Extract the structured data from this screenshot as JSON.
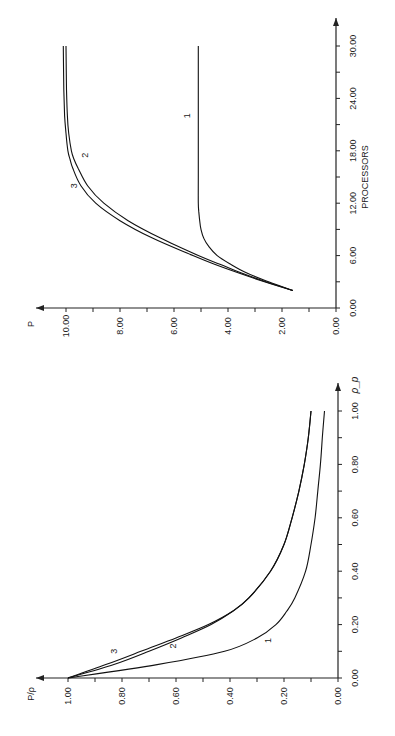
{
  "chart_data": [
    {
      "id": "speedup",
      "type": "line",
      "orientation": "rotated-90-ccw",
      "title": "",
      "xlabel": "PROCESSORS",
      "ylabel": "P",
      "xlim": [
        0,
        30
      ],
      "ylim": [
        0,
        11
      ],
      "xticks": [
        "0.00",
        "6.00",
        "12.00",
        "18.00",
        "24.00",
        "30.00"
      ],
      "yticks": [
        "0.00",
        "2.00",
        "4.00",
        "6.00",
        "8.00",
        "10.00"
      ],
      "grid": false,
      "series": [
        {
          "name": "1",
          "x": [
            2,
            3,
            4,
            5,
            6,
            7,
            8,
            9,
            10,
            11,
            12,
            15,
            20,
            25,
            30
          ],
          "values": [
            1.6,
            2.5,
            3.3,
            3.9,
            4.4,
            4.7,
            4.9,
            5.0,
            5.05,
            5.08,
            5.1,
            5.1,
            5.1,
            5.1,
            5.1
          ]
        },
        {
          "name": "2",
          "x": [
            2,
            3,
            4,
            5,
            6,
            8,
            10,
            12,
            14,
            16,
            17,
            18,
            20,
            22,
            25,
            30
          ],
          "values": [
            1.6,
            2.6,
            3.5,
            4.3,
            5.1,
            6.5,
            7.7,
            8.6,
            9.2,
            9.55,
            9.7,
            9.8,
            9.9,
            9.95,
            9.98,
            10.0
          ]
        },
        {
          "name": "3",
          "x": [
            2,
            3,
            4,
            5,
            6,
            8,
            10,
            12,
            14,
            16,
            17,
            18,
            20,
            22,
            25,
            30
          ],
          "values": [
            1.6,
            2.65,
            3.6,
            4.5,
            5.3,
            6.8,
            8.0,
            8.9,
            9.45,
            9.75,
            9.85,
            9.93,
            10.0,
            10.05,
            10.08,
            10.1
          ]
        }
      ],
      "labels": [
        {
          "text": "1",
          "x": 22,
          "y": 5.4
        },
        {
          "text": "2",
          "x": 17.5,
          "y": 9.2
        },
        {
          "text": "3",
          "x": 14,
          "y": 9.6
        }
      ]
    },
    {
      "id": "efficiency",
      "type": "line",
      "orientation": "rotated-90-ccw",
      "title": "",
      "xlabel": "ρ_p",
      "ylabel": "P/ρ",
      "xlim": [
        0,
        1.0
      ],
      "ylim": [
        0,
        1.0
      ],
      "xticks": [
        "0.00",
        "0.20",
        "0.40",
        "0.60",
        "0.80",
        "1.00"
      ],
      "yticks": [
        "0.00",
        "0.20",
        "0.40",
        "0.60",
        "0.80",
        "1.00"
      ],
      "grid": false,
      "series": [
        {
          "name": "1",
          "x": [
            0.0,
            0.05,
            0.1,
            0.15,
            0.2,
            0.25,
            0.3,
            0.4,
            0.5,
            0.6,
            0.7,
            0.8,
            0.9,
            1.0
          ],
          "values": [
            1.0,
            0.67,
            0.42,
            0.3,
            0.23,
            0.19,
            0.16,
            0.12,
            0.1,
            0.085,
            0.075,
            0.065,
            0.058,
            0.05
          ]
        },
        {
          "name": "2",
          "x": [
            0.0,
            0.05,
            0.1,
            0.15,
            0.2,
            0.25,
            0.3,
            0.4,
            0.5,
            0.6,
            0.7,
            0.8,
            0.9,
            1.0
          ],
          "values": [
            1.0,
            0.83,
            0.7,
            0.58,
            0.47,
            0.39,
            0.33,
            0.25,
            0.2,
            0.17,
            0.145,
            0.125,
            0.11,
            0.1
          ]
        },
        {
          "name": "3",
          "x": [
            0.0,
            0.05,
            0.1,
            0.15,
            0.2,
            0.25,
            0.3,
            0.4,
            0.5,
            0.6,
            0.7,
            0.8,
            0.9,
            1.0
          ],
          "values": [
            1.0,
            0.86,
            0.73,
            0.6,
            0.48,
            0.39,
            0.33,
            0.25,
            0.2,
            0.17,
            0.145,
            0.125,
            0.11,
            0.1
          ]
        }
      ],
      "labels": [
        {
          "text": "1",
          "x": 0.14,
          "y": 0.25
        },
        {
          "text": "2",
          "x": 0.12,
          "y": 0.6
        },
        {
          "text": "3",
          "x": 0.1,
          "y": 0.82
        }
      ]
    }
  ]
}
